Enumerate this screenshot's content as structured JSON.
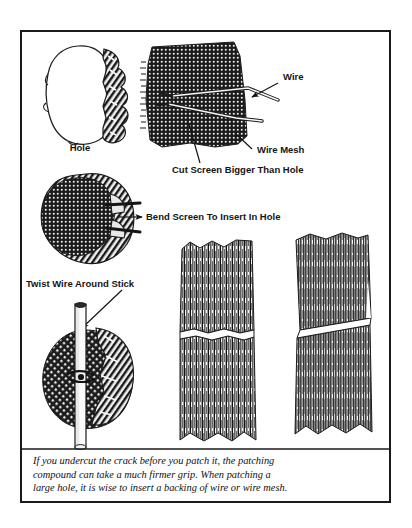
{
  "figure": {
    "type": "instructional-line-drawing",
    "title_visible": false,
    "background_color": "#ffffff",
    "ink_color": "#141414",
    "frame": {
      "name": "figure-border",
      "x": 21,
      "y": 31,
      "width": 369,
      "height": 471,
      "stroke_color": "#1a1a1a",
      "stroke_width": 2
    },
    "divider": {
      "name": "caption-divider",
      "x1": 22,
      "x2": 389,
      "y": 449,
      "stroke_color": "#1a1a1a",
      "stroke_width": 1.4
    },
    "labels": [
      {
        "id": "hole",
        "text": "Hole",
        "x": 80,
        "y": 151,
        "anchor": "middle",
        "font_size": 9.5,
        "has_leader": false
      },
      {
        "id": "wire",
        "text": "Wire",
        "x": 283,
        "y": 80,
        "anchor": "start",
        "font_size": 9.5,
        "has_leader": true
      },
      {
        "id": "wire-mesh",
        "text": "Wire Mesh",
        "x": 257,
        "y": 153,
        "anchor": "start",
        "font_size": 9.5,
        "has_leader": true
      },
      {
        "id": "cut-screen-bigger-than-hole",
        "text": "Cut Screen Bigger Than Hole",
        "x": 172,
        "y": 173,
        "anchor": "start",
        "font_size": 9.5,
        "has_leader": true
      },
      {
        "id": "bend-screen-to-insert-in-hole",
        "text": "Bend Screen To Insert In Hole",
        "x": 146,
        "y": 220,
        "anchor": "start",
        "font_size": 9.5,
        "has_leader": true
      },
      {
        "id": "twist-wire-around-stick",
        "text": "Twist Wire Around Stick",
        "x": 26,
        "y": 287,
        "anchor": "start",
        "font_size": 9.5,
        "has_leader": true
      }
    ],
    "caption": {
      "name": "figure-caption",
      "x": 33,
      "font_size": 10.4,
      "line_height": 13.6,
      "lines": [
        "If you undercut the crack before you patch it, the patching",
        "compound can take a much firmer grip.  When patching a",
        "large hole, it is wise to insert a backing of wire or wire mesh."
      ],
      "first_line_y": 464
    },
    "illustrations": [
      {
        "id": "hole-outline",
        "caption_label": "Hole",
        "description": "irregular rounded hole outline with ragged shaded right edge",
        "bbox": {
          "x": 46,
          "y": 46,
          "width": 80,
          "height": 100
        }
      },
      {
        "id": "screen-patch-with-wires",
        "caption_label": "Wire Mesh",
        "description": "rectangular piece of wire mesh screen cut bigger than hole with two wires threaded through",
        "bbox": {
          "x": 142,
          "y": 40,
          "width": 110,
          "height": 110
        }
      },
      {
        "id": "bent-screen-in-hole",
        "caption_label": "Bend Screen To Insert In Hole",
        "description": "mesh screen bent and inserted into hole, wires protruding",
        "bbox": {
          "x": 40,
          "y": 172,
          "width": 100,
          "height": 94
        }
      },
      {
        "id": "wire-twisted-around-stick",
        "caption_label": "Twist Wire Around Stick",
        "description": "mesh backing pulled tight behind wall by wire twisted around a vertical stick",
        "bbox": {
          "x": 42,
          "y": 300,
          "width": 100,
          "height": 148
        }
      },
      {
        "id": "crack-square-edges",
        "description": "wood grain section with straight-sided crack, not undercut",
        "bbox": {
          "x": 178,
          "y": 240,
          "width": 82,
          "height": 208
        }
      },
      {
        "id": "crack-undercut-edges",
        "description": "wood grain section with wedge-shaped undercut crack",
        "bbox": {
          "x": 290,
          "y": 230,
          "width": 82,
          "height": 216
        }
      }
    ]
  }
}
